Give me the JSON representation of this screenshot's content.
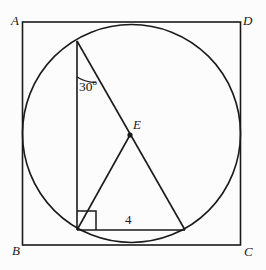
{
  "figure": {
    "stroke_color": "#1a1a1a",
    "background_color": "#fcfcfc",
    "vertex_labels": {
      "top_left": "A",
      "top_right": "D",
      "bottom_left": "B",
      "bottom_right": "C",
      "interior_point": "E"
    },
    "measure_labels": {
      "angle": "30",
      "angle_degree_symbol": "o",
      "angle_full": "30º",
      "base_length": "4"
    },
    "markers": {
      "right_angle": "right-angle-square",
      "point_e_dot": "filled-dot"
    },
    "geometry": {
      "square": {
        "left": 22.5,
        "top": 22,
        "right": 240.5,
        "bottom": 245
      },
      "circle": {
        "cx": 131.5,
        "cy": 133.5,
        "r": 109
      },
      "apex": {
        "x": 77,
        "y": 41
      },
      "base_left": {
        "x": 77,
        "y": 230
      },
      "base_right": {
        "x": 185,
        "y": 230
      },
      "point_e": {
        "x": 130,
        "y": 135
      },
      "right_angle_box": {
        "x": 77,
        "y": 211,
        "size": 19
      },
      "angle_arc_radius": 36
    }
  },
  "labels_positions": {
    "A": {
      "x": 11,
      "y": 14
    },
    "D": {
      "x": 243,
      "y": 14
    },
    "B": {
      "x": 12,
      "y": 244
    },
    "C": {
      "x": 244,
      "y": 245
    },
    "E": {
      "x": 133,
      "y": 118
    },
    "angle": {
      "x": 79,
      "y": 78
    },
    "base_length": {
      "x": 125,
      "y": 213
    }
  }
}
